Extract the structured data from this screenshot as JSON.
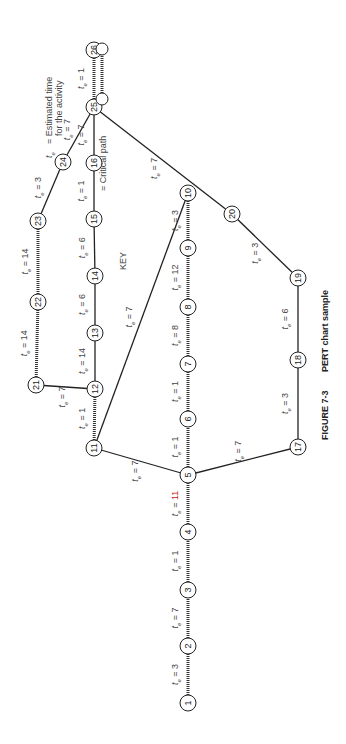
{
  "figure": {
    "caption_number": "FIGURE 7-3",
    "caption_text": "PERT chart sample",
    "orientation": "rotated 90 degrees counter-clockwise"
  },
  "key": {
    "title": "KEY",
    "te_symbol": "t",
    "te_subscript": "e",
    "te_desc_line1": "= Estimated time",
    "te_desc_line2": "for the activity",
    "critical_desc": "= Critical path"
  },
  "nodes": [
    {
      "id": "1",
      "x": 188,
      "y": 703
    },
    {
      "id": "2",
      "x": 188,
      "y": 646
    },
    {
      "id": "3",
      "x": 188,
      "y": 590
    },
    {
      "id": "4",
      "x": 188,
      "y": 532
    },
    {
      "id": "5",
      "x": 188,
      "y": 475
    },
    {
      "id": "6",
      "x": 188,
      "y": 419
    },
    {
      "id": "7",
      "x": 188,
      "y": 364
    },
    {
      "id": "8",
      "x": 188,
      "y": 307
    },
    {
      "id": "9",
      "x": 188,
      "y": 248
    },
    {
      "id": "10",
      "x": 188,
      "y": 193
    },
    {
      "id": "11",
      "x": 94,
      "y": 448
    },
    {
      "id": "12",
      "x": 95,
      "y": 389
    },
    {
      "id": "13",
      "x": 95,
      "y": 333
    },
    {
      "id": "14",
      "x": 95,
      "y": 276
    },
    {
      "id": "15",
      "x": 94,
      "y": 219
    },
    {
      "id": "16",
      "x": 94,
      "y": 163
    },
    {
      "id": "17",
      "x": 298,
      "y": 447
    },
    {
      "id": "18",
      "x": 298,
      "y": 360
    },
    {
      "id": "19",
      "x": 298,
      "y": 278
    },
    {
      "id": "20",
      "x": 232,
      "y": 214
    },
    {
      "id": "21",
      "x": 36,
      "y": 385
    },
    {
      "id": "22",
      "x": 38,
      "y": 302
    },
    {
      "id": "23",
      "x": 38,
      "y": 221
    },
    {
      "id": "24",
      "x": 63,
      "y": 162
    },
    {
      "id": "25",
      "x": 94,
      "y": 107
    },
    {
      "id": "26",
      "x": 94,
      "y": 50
    }
  ],
  "edges": [
    {
      "from": "1",
      "to": "2",
      "te": "3",
      "critical": true
    },
    {
      "from": "2",
      "to": "3",
      "te": "7",
      "critical": true
    },
    {
      "from": "3",
      "to": "4",
      "te": "1",
      "critical": true
    },
    {
      "from": "4",
      "to": "5",
      "te": "11",
      "critical": true,
      "highlight": true
    },
    {
      "from": "5",
      "to": "6",
      "te": "1",
      "critical": true
    },
    {
      "from": "6",
      "to": "7",
      "te": "1",
      "critical": true
    },
    {
      "from": "7",
      "to": "8",
      "te": "8",
      "critical": true
    },
    {
      "from": "8",
      "to": "9",
      "te": "12",
      "critical": true
    },
    {
      "from": "9",
      "to": "10",
      "te": "3",
      "critical": true
    },
    {
      "from": "5",
      "to": "11",
      "te": "7",
      "critical": false
    },
    {
      "from": "11",
      "to": "12",
      "te": "1",
      "critical": true
    },
    {
      "from": "11",
      "to": "10",
      "te": "7",
      "critical": false
    },
    {
      "from": "12",
      "to": "13",
      "te": "14",
      "critical": false
    },
    {
      "from": "13",
      "to": "14",
      "te": "6",
      "critical": false
    },
    {
      "from": "14",
      "to": "15",
      "te": "6",
      "critical": false
    },
    {
      "from": "15",
      "to": "16",
      "te": "1",
      "critical": false
    },
    {
      "from": "16",
      "to": "25",
      "te": "7",
      "critical": false
    },
    {
      "from": "12",
      "to": "21",
      "te": "7",
      "critical": false
    },
    {
      "from": "21",
      "to": "22",
      "te": "14",
      "critical": true
    },
    {
      "from": "22",
      "to": "23",
      "te": "14",
      "critical": true
    },
    {
      "from": "23",
      "to": "24",
      "te": "3",
      "critical": false
    },
    {
      "from": "24",
      "to": "25",
      "te": "7",
      "critical": false
    },
    {
      "from": "25",
      "to": "26",
      "te": "1",
      "critical": true
    },
    {
      "from": "5",
      "to": "17",
      "te": "7",
      "critical": false
    },
    {
      "from": "17",
      "to": "18",
      "te": "3",
      "critical": false
    },
    {
      "from": "18",
      "to": "19",
      "te": "6",
      "critical": false
    },
    {
      "from": "19",
      "to": "20",
      "te": "3",
      "critical": false
    },
    {
      "from": "20",
      "to": "25",
      "te": "7",
      "critical": false
    }
  ],
  "colors": {
    "line": "#222222",
    "text": "#444444",
    "highlight_value": "#cc2222",
    "green_tick": "#3a9a3a"
  }
}
